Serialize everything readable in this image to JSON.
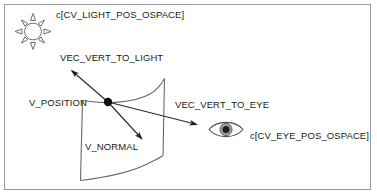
{
  "diagram": {
    "background_color": "#ffffff",
    "frame_color": "#9a9a9a",
    "stroke_color": "#333333",
    "text_color": "#1a1a1a",
    "labels": {
      "light_position": "c[CV_LIGHT_POS_OSPACE]",
      "vec_vert_to_light": "VEC_VERT_TO_LIGHT",
      "v_position": "V_POSITION",
      "vec_vert_to_eye": "VEC_VERT_TO_EYE",
      "eye_position": "c[CV_EYE_POS_OSPACE]",
      "v_normal": "V_NORMAL"
    },
    "icons": {
      "sun": "sun-icon",
      "eye": "eye-icon",
      "vertex_point": "vertex-dot",
      "surface": "curved-surface-patch"
    },
    "vectors": [
      {
        "name": "VEC_VERT_TO_LIGHT",
        "from": "V_POSITION",
        "to": "c[CV_LIGHT_POS_OSPACE]"
      },
      {
        "name": "VEC_VERT_TO_EYE",
        "from": "V_POSITION",
        "to": "c[CV_EYE_POS_OSPACE]"
      },
      {
        "name": "V_NORMAL",
        "from": "V_POSITION",
        "to": "surface normal direction"
      }
    ]
  }
}
